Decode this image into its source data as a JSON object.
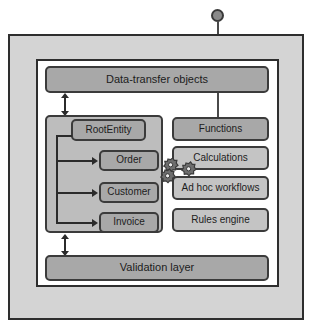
{
  "diagram": {
    "top_node": {
      "name": "entry-point-node",
      "shape": "circle"
    },
    "frames": {
      "outer_label": "",
      "inner_label": ""
    },
    "boxes": {
      "data_transfer": "Data-transfer objects",
      "validation": "Validation layer",
      "functions": "Functions",
      "calculations": "Calculations",
      "workflows": "Ad hoc workflows",
      "rules": "Rules engine",
      "root_entity": "RootEntity",
      "order": "Order",
      "customer": "Customer",
      "invoice": "Invoice"
    },
    "icons": {
      "gears": "gears-icon"
    },
    "colors": {
      "frame_fill": "#d4d4d4",
      "inner_fill": "#ffffff",
      "box_dark": "#a8a8a8",
      "box_mid": "#b4b4b4",
      "box_light": "#c4c4c4",
      "panel_fill": "#bdbdbd",
      "border": "#3b3b3b",
      "connector": "#2b2b2b",
      "node_fill": "#8a8a8a"
    }
  }
}
